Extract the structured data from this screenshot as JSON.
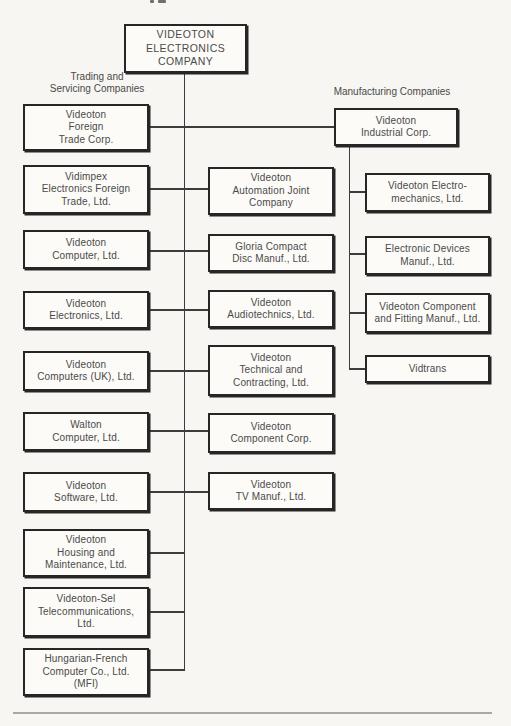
{
  "colors": {
    "paper": "#f7f6f2",
    "box_fill": "#fcfbf8",
    "border": "#262626",
    "line": "#3c3c3c",
    "text": "#4a4a4a",
    "rule": "#a9a8a3"
  },
  "diagram": {
    "root_label": "VIDEOTON\nELECTRONICS\nCOMPANY",
    "trading_group_label": "Trading and\nServicing Companies",
    "manufacturing_group_label": "Manufacturing Companies",
    "trading_parent": "Videoton\nForeign\nTrade Corp.",
    "manufacturing_parent": "Videoton\nIndustrial Corp.",
    "trading_left_column": [
      "Vidimpex\nElectronics Foreign\nTrade, Ltd.",
      "Videoton\nComputer, Ltd.",
      "Videoton\nElectronics, Ltd.",
      "Videoton\nComputers (UK), Ltd.",
      "Walton\nComputer, Ltd.",
      "Videoton\nSoftware, Ltd.",
      "Videoton\nHousing and\nMaintenance, Ltd.",
      "Videoton-Sel\nTelecommunications,\nLtd.",
      "Hungarian-French\nComputer Co., Ltd.\n(MFI)"
    ],
    "trading_center_column": [
      "Videoton\nAutomation Joint\nCompany",
      "Gloria Compact\nDisc Manuf., Ltd.",
      "Videoton\nAudiotechnics, Ltd.",
      "Videoton\nTechnical and\nContracting, Ltd.",
      "Videoton\nComponent Corp.",
      "Videoton\nTV Manuf., Ltd."
    ],
    "manufacturing_column": [
      "Videoton Electro-\nmechanics, Ltd.",
      "Electronic Devices\nManuf., Ltd.",
      "Videoton Component\nand Fitting Manuf., Ltd.",
      "Vidtrans"
    ]
  }
}
